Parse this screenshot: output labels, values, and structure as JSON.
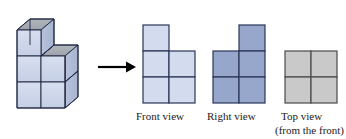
{
  "figure": {
    "type": "orthographic-projection-diagram"
  },
  "solid": {
    "name": "cube-stack",
    "base_grid": [
      2,
      2
    ],
    "base_layers": 2,
    "extra_cube_position": "top-left-rear",
    "total_cubes": 9,
    "face_colors": {
      "front": "#ccd5e8",
      "side": "#b9c4dc",
      "top": "#a9adb5",
      "edge": "#1c2340"
    }
  },
  "arrow": {
    "name": "transformation-arrow",
    "direction": "right",
    "color": "#000000"
  },
  "views": [
    {
      "id": "front",
      "label": "Front view",
      "sublabel": "",
      "fill": "#d3dcee",
      "stroke": "#2b3557",
      "grid": [
        [
          1,
          0
        ],
        [
          1,
          1
        ],
        [
          1,
          1
        ]
      ],
      "cols": 2,
      "rows": 3
    },
    {
      "id": "right",
      "label": "Right view",
      "sublabel": "",
      "fill": "#97a6cb",
      "stroke": "#2b3557",
      "grid": [
        [
          0,
          1
        ],
        [
          1,
          1
        ],
        [
          1,
          1
        ]
      ],
      "cols": 2,
      "rows": 3
    },
    {
      "id": "top",
      "label": "Top view",
      "sublabel": "(from the front)",
      "fill": "#c9c9c9",
      "stroke": "#4a4a4a",
      "grid": [
        [
          1,
          1
        ],
        [
          1,
          1
        ]
      ],
      "cols": 2,
      "rows": 2
    }
  ],
  "colors": {
    "background": "#ffffff",
    "text": "#1a1a1a"
  }
}
